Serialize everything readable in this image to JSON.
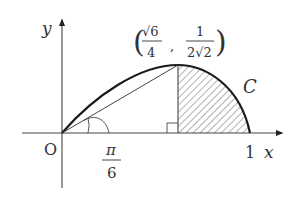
{
  "figure": {
    "type": "polar-curve-area-diagram",
    "axes": {
      "x_label": "x",
      "y_label": "y",
      "origin_label": "O",
      "x_tick_label": "1"
    },
    "curve_label": "C",
    "point": {
      "x_num": "√6",
      "x_den": "4",
      "y_num": "1",
      "y_den": "2√2",
      "open_paren": "(",
      "comma": ",",
      "close_paren": ")"
    },
    "angle": {
      "num": "π",
      "den": "6"
    },
    "shaded_region": "area under C from x=√6/4 to x=1",
    "colors": {
      "ink": "#333333",
      "curve": "#1a1a1a",
      "hatch": "#555555",
      "background": "#ffffff"
    }
  }
}
